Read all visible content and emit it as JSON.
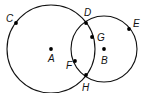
{
  "diagram": {
    "type": "geometry-intersecting-circles",
    "colors": {
      "stroke": "#111111",
      "point": "#000000",
      "background": "#ffffff"
    },
    "circles": [
      {
        "name": "circle-A",
        "center": "A",
        "cx": 51,
        "cy": 49,
        "r": 44
      },
      {
        "name": "circle-B",
        "center": "B",
        "cx": 104,
        "cy": 49,
        "r": 33
      }
    ],
    "points": [
      {
        "id": "A",
        "label": "A",
        "x": 51,
        "y": 49,
        "lx": 48,
        "ly": 62
      },
      {
        "id": "B",
        "label": "B",
        "x": 104,
        "y": 49,
        "lx": 101,
        "ly": 64
      },
      {
        "id": "C",
        "label": "C",
        "x": 16,
        "y": 23,
        "lx": 6,
        "ly": 22
      },
      {
        "id": "D",
        "label": "D",
        "x": 86,
        "y": 23,
        "lx": 84,
        "ly": 16
      },
      {
        "id": "E",
        "label": "E",
        "x": 129,
        "y": 29,
        "lx": 133,
        "ly": 27
      },
      {
        "id": "G",
        "label": "G",
        "x": 92,
        "y": 37,
        "lx": 97,
        "ly": 41
      },
      {
        "id": "F",
        "label": "F",
        "x": 75,
        "y": 61,
        "lx": 66,
        "ly": 69
      },
      {
        "id": "H",
        "label": "H",
        "x": 86,
        "y": 75,
        "lx": 82,
        "ly": 91
      }
    ]
  }
}
